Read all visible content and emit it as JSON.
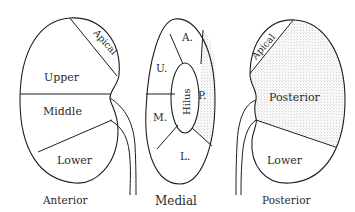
{
  "figure": {
    "views": [
      {
        "id": "anterior",
        "caption": "Anterior",
        "segments": [
          {
            "label": "Apical",
            "shaded": false
          },
          {
            "label": "Upper",
            "shaded": false
          },
          {
            "label": "Middle",
            "shaded": false
          },
          {
            "label": "Lower",
            "shaded": false
          }
        ]
      },
      {
        "id": "medial",
        "caption": "Medial",
        "segments": [
          {
            "label": "A.",
            "shaded": false
          },
          {
            "label": "U.",
            "shaded": false
          },
          {
            "label": "M.",
            "shaded": false
          },
          {
            "label": "L.",
            "shaded": false
          },
          {
            "label": "P.",
            "shaded": true
          },
          {
            "label": "Hilus",
            "shaded": false
          }
        ]
      },
      {
        "id": "posterior",
        "caption": "Posterior",
        "segments": [
          {
            "label": "Apical",
            "shaded": false
          },
          {
            "label": "Posterior",
            "shaded": true
          },
          {
            "label": "Lower",
            "shaded": false
          }
        ]
      }
    ],
    "colors": {
      "line": "#1e1e1e",
      "stipple": "#8a8a8a",
      "background": "#ffffff"
    }
  }
}
